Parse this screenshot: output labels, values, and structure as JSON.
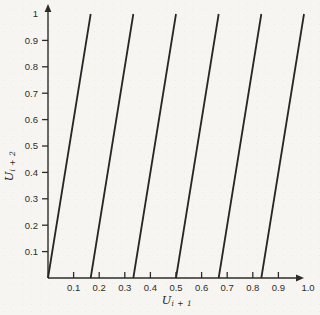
{
  "colors": {
    "background": "#f6f5f1",
    "line": "#262626",
    "axis": "#2e2c29",
    "text": "#2e2c29"
  },
  "chart_data": {
    "type": "line",
    "title": "",
    "xlabel_main": "U",
    "xlabel_sub": "i + 1",
    "ylabel_main": "U",
    "ylabel_sub": "i + 2",
    "xlim": [
      0,
      1
    ],
    "ylim": [
      0,
      1
    ],
    "grid": false,
    "legend": false,
    "x_ticks": [
      {
        "value": 0.1,
        "label": "0.1",
        "tick": true
      },
      {
        "value": 0.2,
        "label": "0.2",
        "tick": true
      },
      {
        "value": 0.3,
        "label": "0.3",
        "tick": true
      },
      {
        "value": 0.4,
        "label": "0.4",
        "tick": true
      },
      {
        "value": 0.5,
        "label": "0.5",
        "tick": true
      },
      {
        "value": 0.6,
        "label": "0.6",
        "tick": true
      },
      {
        "value": 0.7,
        "label": "0.7",
        "tick": true
      },
      {
        "value": 0.8,
        "label": "0.8",
        "tick": true
      },
      {
        "value": 0.9,
        "label": "0.9",
        "tick": true
      },
      {
        "value": 1.0,
        "label": "1.0",
        "tick": false
      }
    ],
    "y_ticks": [
      {
        "value": 0.1,
        "label": "0.1",
        "tick": true
      },
      {
        "value": 0.2,
        "label": "0.2",
        "tick": true
      },
      {
        "value": 0.3,
        "label": "0.3",
        "tick": true
      },
      {
        "value": 0.4,
        "label": "0.4",
        "tick": true
      },
      {
        "value": 0.5,
        "label": "0.5",
        "tick": true
      },
      {
        "value": 0.6,
        "label": "0.6",
        "tick": true
      },
      {
        "value": 0.7,
        "label": "0.7",
        "tick": true
      },
      {
        "value": 0.8,
        "label": "0.8",
        "tick": true
      },
      {
        "value": 0.9,
        "label": "0.9",
        "tick": true
      },
      {
        "value": 1.0,
        "label": "1",
        "tick": false
      }
    ],
    "slope": 6,
    "lines": [
      {
        "from": [
          0.0,
          0
        ],
        "to": [
          0.1667,
          1
        ]
      },
      {
        "from": [
          0.1667,
          0
        ],
        "to": [
          0.3333,
          1
        ]
      },
      {
        "from": [
          0.3333,
          0
        ],
        "to": [
          0.5,
          1
        ]
      },
      {
        "from": [
          0.5,
          0
        ],
        "to": [
          0.6667,
          1
        ]
      },
      {
        "from": [
          0.6667,
          0
        ],
        "to": [
          0.8333,
          1
        ]
      },
      {
        "from": [
          0.8333,
          0
        ],
        "to": [
          1.0,
          1
        ]
      }
    ]
  }
}
